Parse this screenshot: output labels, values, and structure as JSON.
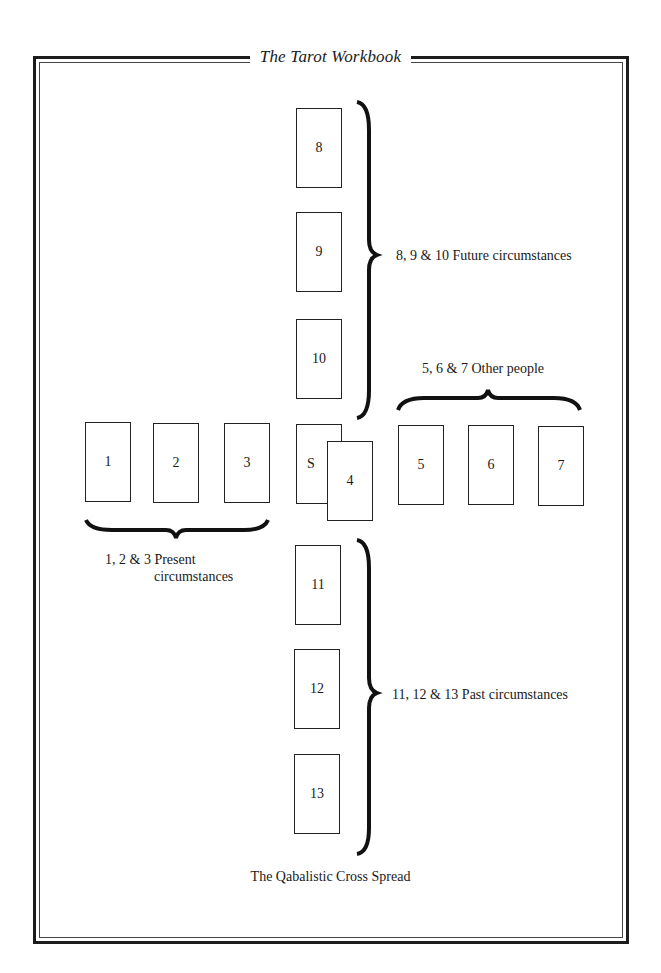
{
  "header": {
    "title": "The Tarot Workbook"
  },
  "spread": {
    "caption": "The Qabalistic Cross Spread",
    "cards": {
      "c8": "8",
      "c9": "9",
      "c10": "10",
      "c1": "1",
      "c2": "2",
      "c3": "3",
      "cS": "S",
      "c4": "4",
      "c5": "5",
      "c6": "6",
      "c7": "7",
      "c11": "11",
      "c12": "12",
      "c13": "13"
    },
    "groups": {
      "future": "8, 9 & 10 Future circumstances",
      "other": "5, 6 & 7 Other people",
      "present_line1": "1, 2 & 3 Present",
      "present_line2": "circumstances",
      "past": "11, 12 & 13 Past circumstances"
    }
  }
}
